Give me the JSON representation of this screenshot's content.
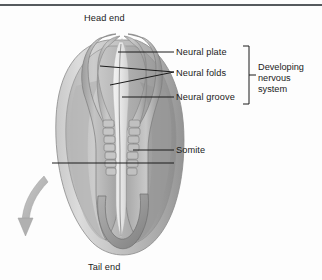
{
  "figure": {
    "title_rule": true,
    "orientation_labels": {
      "head": "Head end",
      "tail": "Tail end"
    },
    "labels": [
      {
        "id": "neural-plate",
        "text": "Neural plate"
      },
      {
        "id": "neural-folds",
        "text": "Neural folds"
      },
      {
        "id": "neural-groove",
        "text": "Neural groove"
      },
      {
        "id": "somite",
        "text": "Somite"
      }
    ],
    "bracket_group": {
      "line1": "Developing",
      "line2": "nervous",
      "line3": "system"
    },
    "rotation_arrow": {
      "name": "rotation-arrow",
      "direction": "down-left-curved"
    },
    "colors": {
      "background": "#fdfdfd",
      "rule": "#555a5e",
      "leader_line": "#1b1b1b",
      "text": "#1b1b1b",
      "embryo_outer_light": "#d8d8d8",
      "embryo_outer_mid": "#b9b9b9",
      "embryo_outer_dark": "#9a9a9a",
      "embryo_fold_light": "#cfcfcf",
      "embryo_fold_dark": "#8f8f8f",
      "groove_highlight": "#f0f0f0",
      "somite_fill": "#c6c6c6",
      "somite_edge": "#7e7e7e",
      "arrow_fill": "#b5b5b5"
    }
  }
}
